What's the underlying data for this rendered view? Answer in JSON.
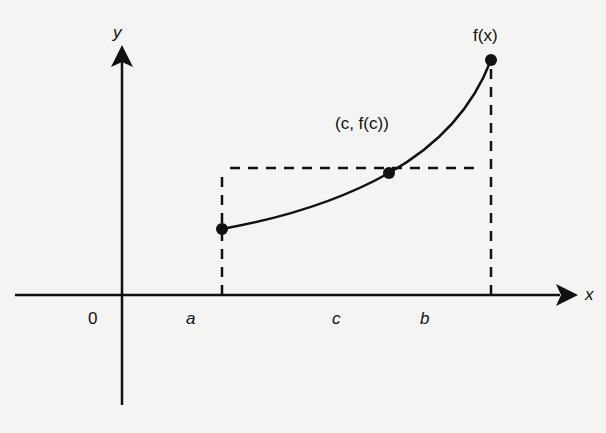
{
  "diagram": {
    "axes": {
      "x_label": "x",
      "y_label": "y",
      "origin_label": "0"
    },
    "points_on_x_axis": [
      {
        "label": "a"
      },
      {
        "label": "c"
      },
      {
        "label": "b"
      }
    ],
    "curve_label": "f(x)",
    "mean_point_label": "(c, f(c))",
    "colors": {
      "background": "#f4f4f2",
      "ink": "#111111"
    }
  }
}
